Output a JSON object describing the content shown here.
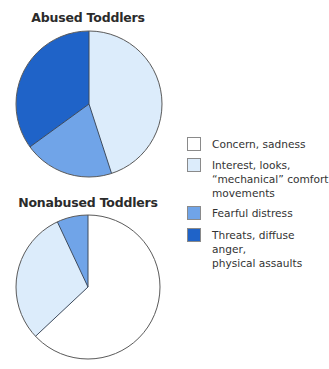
{
  "chart_data": [
    {
      "type": "pie",
      "title": "Abused Toddlers",
      "start_angle_deg": 0,
      "direction": "clockwise",
      "slices": [
        {
          "label": "Concern, sadness",
          "value": 0,
          "color": "#ffffff"
        },
        {
          "label": "Interest, looks, “mechanical” comfort movements",
          "value": 45,
          "color": "#dcecfb"
        },
        {
          "label": "Fearful distress",
          "value": 20,
          "color": "#70a4e8"
        },
        {
          "label": "Threats, diffuse anger, physical assaults",
          "value": 35,
          "color": "#1f63c8"
        }
      ]
    },
    {
      "type": "pie",
      "title": "Nonabused Toddlers",
      "start_angle_deg": 0,
      "direction": "clockwise",
      "slices": [
        {
          "label": "Concern, sadness",
          "value": 63,
          "color": "#ffffff"
        },
        {
          "label": "Interest, looks, “mechanical” comfort movements",
          "value": 30,
          "color": "#dcecfb"
        },
        {
          "label": "Fearful distress",
          "value": 7,
          "color": "#70a4e8"
        },
        {
          "label": "Threats, diffuse anger, physical assaults",
          "value": 0,
          "color": "#1f63c8"
        }
      ]
    }
  ],
  "titles": {
    "abused": "Abused Toddlers",
    "nonabused": "Nonabused Toddlers"
  },
  "legend": {
    "position": "right",
    "items": [
      {
        "label": "Concern, sadness",
        "color": "#ffffff"
      },
      {
        "label": "Interest, looks,\n“mechanical” comfort\nmovements",
        "color": "#dcecfb"
      },
      {
        "label": "Fearful distress",
        "color": "#70a4e8"
      },
      {
        "label": "Threats, diffuse anger,\nphysical assaults",
        "color": "#1f63c8"
      }
    ]
  },
  "style": {
    "outline_color": "#5a5a5a",
    "divider_color": "#3d4a5c"
  }
}
